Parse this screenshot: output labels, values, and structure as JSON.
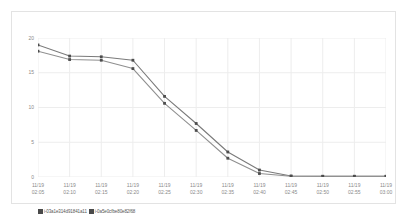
{
  "chart_data": {
    "type": "line",
    "title": "",
    "xlabel": "",
    "ylabel": "",
    "ylim": [
      0,
      20
    ],
    "yticks": [
      0,
      5,
      10,
      15,
      20
    ],
    "grid": true,
    "legend_position": "bottom-left",
    "date": "11/19",
    "categories": [
      "02:05",
      "02:10",
      "02:15",
      "02:20",
      "02:25",
      "02:30",
      "02:35",
      "02:40",
      "02:45",
      "02:50",
      "02:55",
      "03:00"
    ],
    "x_tick_labels": [
      {
        "date": "11/19",
        "time": "02:05"
      },
      {
        "date": "11/19",
        "time": "02:10"
      },
      {
        "date": "11/19",
        "time": "02:15"
      },
      {
        "date": "11/19",
        "time": "02:20"
      },
      {
        "date": "11/19",
        "time": "02:25"
      },
      {
        "date": "11/19",
        "time": "02:30"
      },
      {
        "date": "11/19",
        "time": "02:35"
      },
      {
        "date": "11/19",
        "time": "02:40"
      },
      {
        "date": "11/19",
        "time": "02:45"
      },
      {
        "date": "11/19",
        "time": "02:50"
      },
      {
        "date": "11/19",
        "time": "02:55"
      },
      {
        "date": "11/19",
        "time": "03:00"
      }
    ],
    "series": [
      {
        "name": "i-03a1e314d91841a11",
        "color": "#7a7a7a",
        "values": [
          19.0,
          17.4,
          17.3,
          16.8,
          11.6,
          7.7,
          3.6,
          1.0,
          0.15,
          0.1,
          0.1,
          0.1
        ]
      },
      {
        "name": "i-0a5e0cfbe80e82f68",
        "color": "#8f8f8f",
        "values": [
          18.1,
          16.9,
          16.8,
          15.6,
          10.6,
          6.7,
          2.7,
          0.5,
          0.1,
          0.1,
          0.1,
          0.1
        ]
      }
    ]
  },
  "legend": {
    "items": [
      {
        "label": "i-03a1e314d91841a11"
      },
      {
        "label": "i-0a5e0cfbe80e82f68"
      }
    ]
  }
}
